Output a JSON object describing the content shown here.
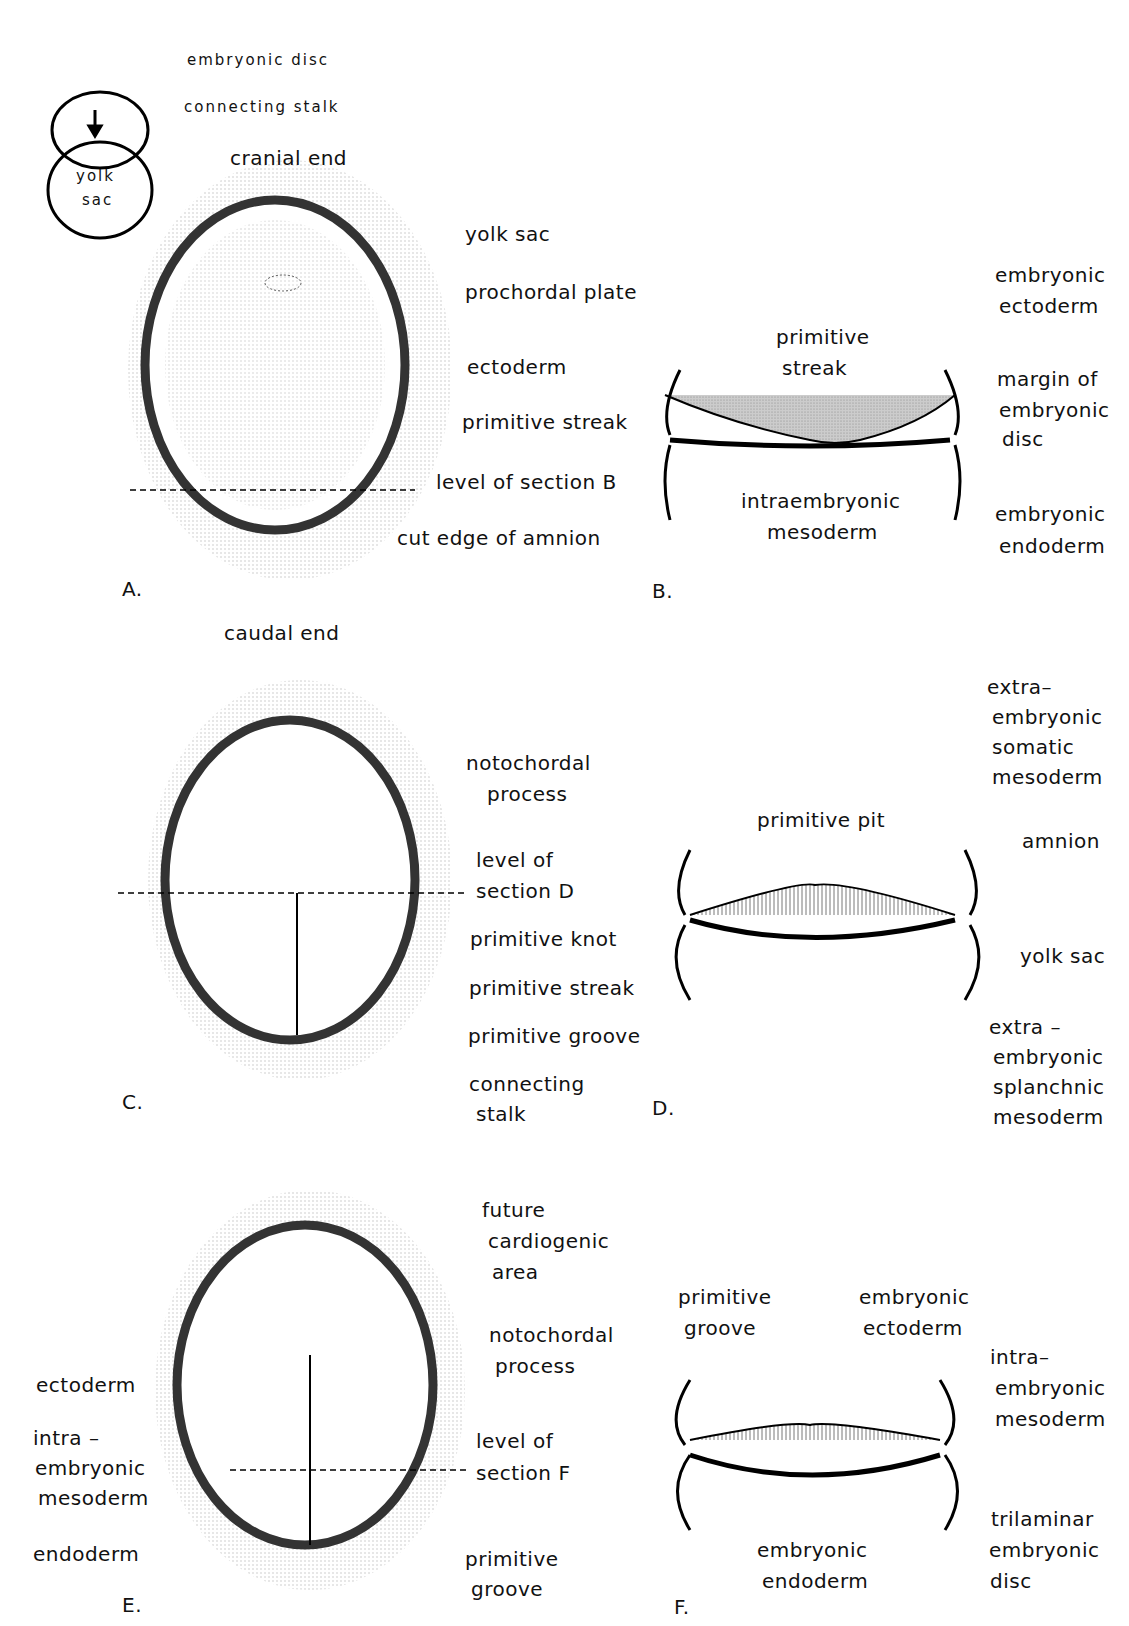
{
  "panels": {
    "A": {
      "letter": "A.",
      "orientation": {
        "top": "cranial end",
        "bottom": "caudal end"
      },
      "inset": {
        "yolk_sac_line1": "yolk",
        "yolk_sac_line2": "sac",
        "embryonic_disc": "embryonic disc",
        "connecting_stalk": "connecting stalk"
      },
      "labels": [
        "yolk sac",
        "prochordal plate",
        "ectoderm",
        "primitive streak",
        "level of section B",
        "cut edge of amnion"
      ]
    },
    "B": {
      "letter": "B.",
      "labels": {
        "primitive_streak_1": "primitive",
        "primitive_streak_2": "streak",
        "emb_ecto_1": "embryonic",
        "emb_ecto_2": "ectoderm",
        "margin_1": "margin of",
        "margin_2": "embryonic",
        "margin_3": "disc",
        "intra_1": "intraembryonic",
        "intra_2": "mesoderm",
        "emb_endo_1": "embryonic",
        "emb_endo_2": "endoderm"
      }
    },
    "C": {
      "letter": "C.",
      "labels": {
        "noto_1": "notochordal",
        "noto_2": "process",
        "level_1": "level of",
        "level_2": "section D",
        "knot": "primitive knot",
        "streak": "primitive streak",
        "groove": "primitive groove",
        "stalk_1": "connecting",
        "stalk_2": "stalk"
      }
    },
    "D": {
      "letter": "D.",
      "labels": {
        "pit": "primitive pit",
        "som_1": "extra–",
        "som_2": "embryonic",
        "som_3": "somatic",
        "som_4": "mesoderm",
        "amnion": "amnion",
        "yolk": "yolk sac",
        "spl_1": "extra –",
        "spl_2": "embryonic",
        "spl_3": "splanchnic",
        "spl_4": "mesoderm"
      }
    },
    "E": {
      "letter": "E.",
      "labels": {
        "card_1": "future",
        "card_2": "cardiogenic",
        "card_3": "area",
        "noto_1": "notochordal",
        "noto_2": "process",
        "level_1": "level of",
        "level_2": "section F",
        "groove_1": "primitive",
        "groove_2": "groove",
        "ecto": "ectoderm",
        "meso_1": "intra –",
        "meso_2": "embryonic",
        "meso_3": "mesoderm",
        "endo": "endoderm"
      }
    },
    "F": {
      "letter": "F.",
      "labels": {
        "groove_1": "primitive",
        "groove_2": "groove",
        "ecto_1": "embryonic",
        "ecto_2": "ectoderm",
        "meso_1": "intra–",
        "meso_2": "embryonic",
        "meso_3": "mesoderm",
        "tri_1": "trilaminar",
        "tri_2": "embryonic",
        "tri_3": "disc",
        "endo_1": "embryonic",
        "endo_2": "endoderm"
      }
    }
  }
}
